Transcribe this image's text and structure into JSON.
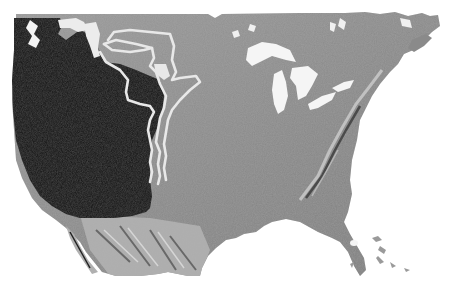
{
  "map": {
    "type": "shaded-relief",
    "region": "North America (contiguous United States)",
    "colors": {
      "background": "#ffffff",
      "land": "#8a8a8a",
      "land_light": "#a4a4a4",
      "shaded_region": "#141414",
      "water_lakes": "#f0f0f0",
      "boundary_lines": "#e6e6e6",
      "relief_highlight": "#d8d8d8",
      "relief_shadow": "#3a3a3a"
    },
    "layers": [
      {
        "name": "land-relief",
        "description": "grayscale hillshade of continent"
      },
      {
        "name": "shaded-west-region",
        "description": "dark overlay covering the western United States"
      },
      {
        "name": "great-lakes",
        "description": "white lake polygons"
      },
      {
        "name": "boundary-outlines",
        "description": "three nested light outline lines along eastern edge of shaded region"
      }
    ]
  }
}
